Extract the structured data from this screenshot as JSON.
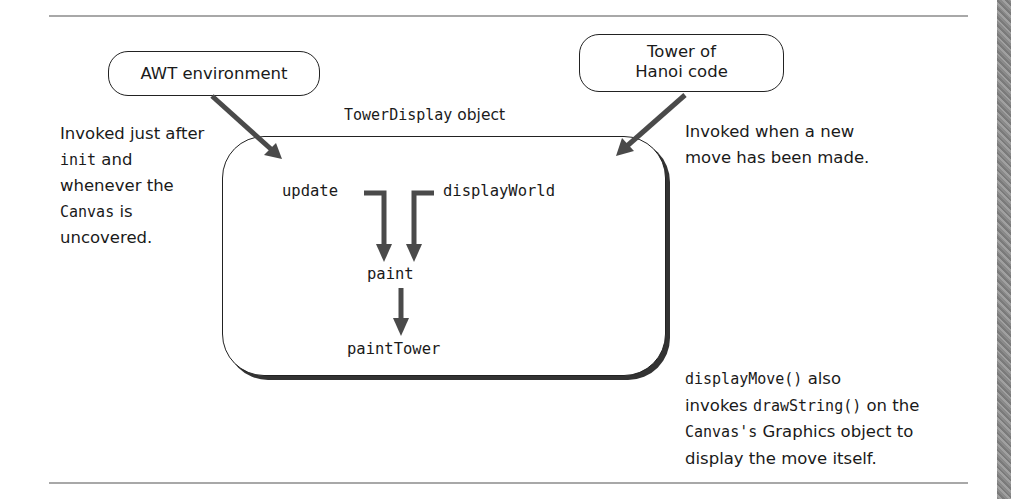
{
  "diagram": {
    "actors": {
      "awt": {
        "label": "AWT environment"
      },
      "hanoi": {
        "line1": "Tower of",
        "line2": "Hanoi code"
      }
    },
    "object_box": {
      "title_code": "TowerDisplay",
      "title_suffix": " object"
    },
    "methods": {
      "update": "update",
      "display_world": "displayWorld",
      "paint": "paint",
      "paint_tower": "paintTower"
    },
    "notes": {
      "left": {
        "line1": "Invoked just after",
        "line2_code": "init",
        "line2_text": " and",
        "line3": "whenever the",
        "line4_code": "Canvas",
        "line4_text": " is",
        "line5": "uncovered."
      },
      "right": {
        "line1": "Invoked when a new",
        "line2": "move has been made."
      },
      "bottom_right": {
        "line1_code": "displayMove()",
        "line1_text": " also",
        "line2_text_a": "invokes ",
        "line2_code": "drawString()",
        "line2_text_b": " on the",
        "line3_code": "Canvas's",
        "line3_text": " Graphics object to",
        "line4": "display the move itself."
      }
    },
    "colors": {
      "arrow": "#4a4a4a",
      "rule": "#a8a8a8",
      "border": "#222222",
      "shadow": "#333333"
    }
  }
}
